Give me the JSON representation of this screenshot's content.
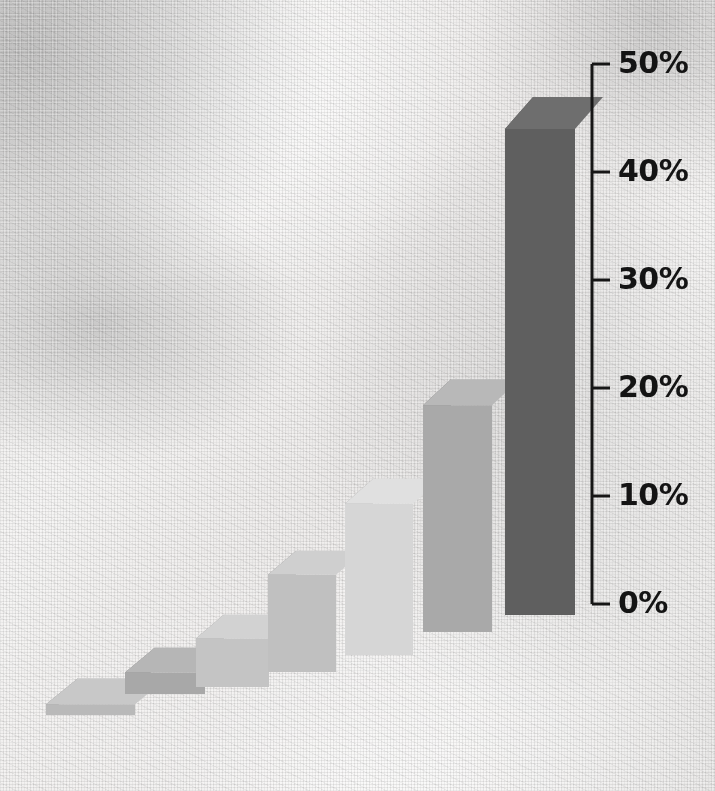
{
  "chart_data": {
    "type": "bar",
    "title": "",
    "subtitle": "",
    "xlabel": "",
    "ylabel": "",
    "categories": [
      "1",
      "2",
      "3",
      "4",
      "5",
      "6",
      "7"
    ],
    "values": [
      1,
      2,
      4.5,
      9,
      14,
      21,
      45
    ],
    "value_labels": [
      "1%",
      "2%",
      "4.5%",
      "9%",
      "14%",
      "21%",
      "45%"
    ],
    "ylim": [
      0,
      50
    ],
    "y_ticks": [
      0,
      10,
      20,
      30,
      40,
      50
    ],
    "y_tick_labels": [
      "0%",
      "10%",
      "20%",
      "30%",
      "40%",
      "50%"
    ],
    "grid": false,
    "legend": null,
    "style": "3d-isometric-bars-on-canvas-texture",
    "axis_position": "right",
    "bar_colors": [
      "#b9b9b9",
      "#a8a8a8",
      "#c4c4c4",
      "#c0c0c0",
      "#d6d6d6",
      "#a9a9a9",
      "#5f5f5f"
    ],
    "bar_top_colors": [
      "#c8c8c8",
      "#b6b6b6",
      "#d2d2d2",
      "#cfcfcf",
      "#e0e0e0",
      "#b8b8b8",
      "#6e6e6e"
    ],
    "bar_side_colors": [
      "#8e8e8e",
      "#7e7e7e",
      "#9a9a9a",
      "#8d8d8d",
      "#a3a3a3",
      "#7c7c7c",
      "#4a4a4a"
    ]
  },
  "axis": {
    "labels": [
      "50%",
      "40%",
      "30%",
      "20%",
      "10%",
      "0%"
    ],
    "line_color": "#161616"
  },
  "background": {
    "description": "white woven canvas / linen fabric texture",
    "base_color": "#f0efee"
  }
}
